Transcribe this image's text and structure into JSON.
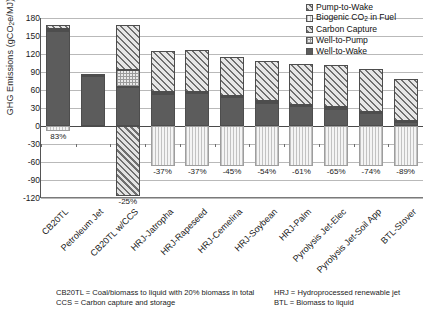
{
  "chart_data": {
    "type": "bar",
    "title": "",
    "xlabel": "",
    "ylabel": "GHG Emissions (gCO₂e/MJ)",
    "ylim": [
      -120,
      180
    ],
    "yticks": [
      180,
      150,
      120,
      90,
      60,
      30,
      0,
      -30,
      -60,
      -90,
      -120
    ],
    "grid": true,
    "legend_position": "top-right",
    "stacked": true,
    "categories": [
      "CB20TL",
      "Petroleum Jet",
      "CB20TL w/CCS",
      "HRJ-Jatropha",
      "HRJ-Rapeseed",
      "HRJ-Cemelina",
      "HRJ-Soybean",
      "HRJ-Palm",
      "Pyrolysis Jet-Elec",
      "Pyrolysis Jet-Soil App",
      "BTL-Stover"
    ],
    "series": [
      {
        "name": "Well-to-Wake",
        "values": [
          158,
          84,
          65,
          54,
          55,
          48,
          39,
          33,
          29,
          21,
          7
        ]
      },
      {
        "name": "Well-to-Pump",
        "values": [
          4,
          2,
          28,
          2,
          2,
          2,
          2,
          2,
          2,
          2,
          2
        ]
      },
      {
        "name": "Pump-to-Wake",
        "values": [
          6,
          1,
          75,
          69,
          69,
          65,
          68,
          68,
          70,
          72,
          70
        ]
      },
      {
        "name": "Carbon Capture",
        "values": [
          0,
          0,
          -117,
          0,
          0,
          0,
          0,
          0,
          0,
          0,
          0
        ]
      },
      {
        "name": "Biogenic CO₂ in Fuel",
        "values": [
          -9,
          0,
          0,
          -66,
          -66,
          -66,
          -66,
          -66,
          -66,
          -66,
          -66
        ]
      }
    ],
    "bar_totals": [
      168,
      87,
      168,
      125,
      125,
      115,
      109,
      103,
      101,
      95,
      79
    ],
    "annotations": [
      {
        "category": "CB20TL",
        "text": "83%"
      },
      {
        "category": "CB20TL w/CCS",
        "text": "-25%"
      },
      {
        "category": "HRJ-Jatropha",
        "text": "-37%"
      },
      {
        "category": "HRJ-Rapeseed",
        "text": "-37%"
      },
      {
        "category": "HRJ-Cemelina",
        "text": "-45%"
      },
      {
        "category": "HRJ-Soybean",
        "text": "-54%"
      },
      {
        "category": "HRJ-Palm",
        "text": "-61%"
      },
      {
        "category": "Pyrolysis Jet-Elec",
        "text": "-65%"
      },
      {
        "category": "Pyrolysis Jet-Soil App",
        "text": "-74%"
      },
      {
        "category": "BTL-Stover",
        "text": "-89%"
      }
    ]
  },
  "yaxis": {
    "title": "GHG Emissions (gCO₂e/MJ)",
    "ticks": [
      "180",
      "150",
      "120",
      "90",
      "60",
      "30",
      "0",
      "-30",
      "-60",
      "-90",
      "-120"
    ]
  },
  "legend": {
    "items": [
      {
        "label_pre": "Pump-to-Wake",
        "label_sub": "",
        "label_post": "",
        "swatch": "hatch-diagonal"
      },
      {
        "label_pre": "Biogenic CO",
        "label_sub": "2",
        "label_post": " in Fuel",
        "swatch": "vertical-stripes"
      },
      {
        "label_pre": "Carbon Capture",
        "label_sub": "",
        "label_post": "",
        "swatch": "hatch-dense"
      },
      {
        "label_pre": "Well-to-Pump",
        "label_sub": "",
        "label_post": "",
        "swatch": "checker"
      },
      {
        "label_pre": "Well-to-Wake",
        "label_sub": "",
        "label_post": "",
        "swatch": "solid-dark"
      }
    ]
  },
  "xaxis": {
    "labels": [
      "CB20TL",
      "Petroleum Jet",
      "CB20TL w/CCS",
      "HRJ-Jatropha",
      "HRJ-Rapeseed",
      "HRJ-Cemelina",
      "HRJ-Soybean",
      "HRJ-Palm",
      "Pyrolysis Jet-Elec",
      "Pyrolysis Jet-Soil App",
      "BTL-Stover"
    ]
  },
  "footnotes": {
    "left_line1": "CB20TL = Coal/biomass to liquid with 20% biomass in total",
    "left_line2": "CCS = Carbon capture and storage",
    "right_line1": "HRJ = Hydroprocessed renewable jet",
    "right_line2": "BTL = Biomass to liquid"
  },
  "colors": {
    "well_to_wake": "#5c5c5c",
    "well_to_pump": "#e9e9e9",
    "pump_to_wake": "#dcdcdc",
    "carbon_capture": "#d6d6d6",
    "biogenic_co2": "#f1f1f1",
    "gridline": "#b9b9b9",
    "axis": "#4a4a4a"
  }
}
